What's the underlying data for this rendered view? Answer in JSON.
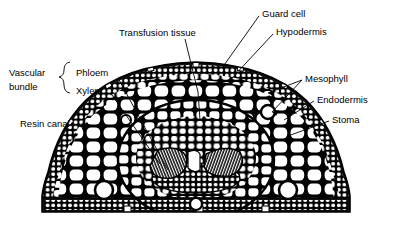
{
  "figure": {
    "kind": "botanical-cross-section",
    "background_color": "#ffffff",
    "ink_color": "#000000"
  },
  "labels": {
    "transfusion_tissue": "Transfusion tissue",
    "guard_cell": "Guard cell",
    "hypodermis": "Hypodermis",
    "vascular_bundle_line1": "Vascular",
    "vascular_bundle_line2": "bundle",
    "phloem": "Phloem",
    "xylem": "Xylem",
    "resin_canal": "Resin canal",
    "mesophyll": "Mesophyll",
    "endodermis": "Endodermis",
    "stoma": "Stoma"
  },
  "structures": {
    "epidermis": "epidermis-outer-layer",
    "hypodermis": "hypodermis-thick-walled-layer",
    "mesophyll": "mesophyll-folded-parenchyma",
    "endodermis": "endodermis-ring",
    "transfusion_tissue": "transfusion-tissue-zone",
    "xylem_left": "xylem-strand-left",
    "xylem_right": "xylem-strand-right",
    "phloem": "phloem-zone",
    "resin_canal_left": "resin-canal-left",
    "resin_canal_right": "resin-canal-right",
    "resin_canal_bottom": "resin-canal-bottom",
    "stomata_notches": "stomatal-pit-notches"
  }
}
